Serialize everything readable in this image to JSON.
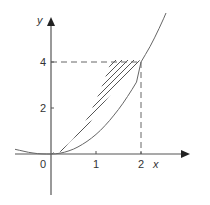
{
  "diagram": {
    "type": "area-between-curves",
    "axes": {
      "x_label": "x",
      "y_label": "y",
      "origin_label": "0",
      "x_ticks": [
        "1",
        "2"
      ],
      "y_ticks": [
        "2",
        "4"
      ]
    },
    "curves": [
      {
        "name": "parabola",
        "label": "y = x²",
        "equation": "y = x^2"
      },
      {
        "name": "sideways-parabola",
        "label_line1": "y² = 8x",
        "label_line2": "(or y = √8x)",
        "equation": "y^2 = 8x"
      }
    ],
    "intersection": {
      "x": 2,
      "y": 4
    },
    "guides": {
      "vertical_at_x": 2,
      "horizontal_at_y": 4
    },
    "shaded_region": "area between y = x² and y = √(8x) from x = 0 to x = 2",
    "colors": {
      "line": "#555555",
      "text": "#333333",
      "background": "#ffffff"
    }
  },
  "labels": {
    "y_axis": "y",
    "x_axis": "x",
    "origin": "0",
    "tick_x1": "1",
    "tick_x2": "2",
    "tick_y2": "2",
    "tick_y4": "4",
    "curve1_prefix": "y",
    "curve1_eq": " = x",
    "curve1_exp": "2",
    "curve2_line1_y": "y",
    "curve2_line1_exp": "2",
    "curve2_line1_rest": " = 8x",
    "curve2_line2": "(or y = √8x)"
  }
}
